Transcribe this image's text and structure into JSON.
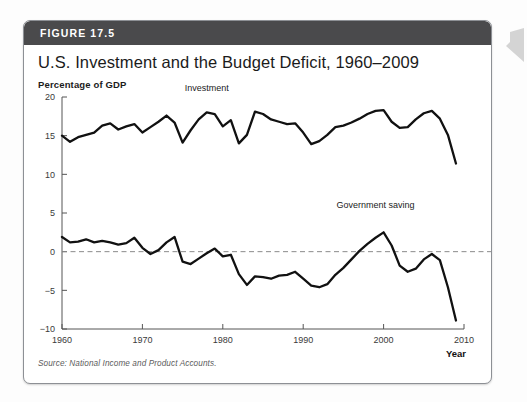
{
  "figure": {
    "number_label": "FIGURE 17.5",
    "title": "U.S. Investment and the Budget Deficit, 1960–2009",
    "source_note": "Source: National Income and Product Accounts.",
    "header_color": "#4a4a4c",
    "line_color": "#111111",
    "zero_line_color": "#8a8a8a"
  },
  "chart_data": {
    "type": "line",
    "title": "U.S. Investment and the Budget Deficit, 1960–2009",
    "subtitle": "",
    "xlabel": "Year",
    "ylabel": "Percentage of GDP",
    "ylim": [
      -10,
      20
    ],
    "xlim": [
      1960,
      2010
    ],
    "y_ticks": [
      -10,
      -5,
      0,
      5,
      10,
      15,
      20
    ],
    "y_tick_labels": [
      "−10",
      "−5",
      "0",
      "5",
      "10",
      "15",
      "20"
    ],
    "x_ticks": [
      1960,
      1970,
      1980,
      1990,
      2000,
      2010
    ],
    "x_tick_labels": [
      "1960",
      "1970",
      "1980",
      "1990",
      "2000",
      "2010"
    ],
    "grid": false,
    "legend_position": "inline-annotations",
    "annotations": [
      {
        "text": "Investment",
        "x": 1978,
        "y": 20.8
      },
      {
        "text": "Government saving",
        "x": 1999,
        "y": 5.6
      }
    ],
    "reference_lines": [
      {
        "y": 0,
        "style": "dashed",
        "color": "#8a8a8a"
      }
    ],
    "x": [
      1960,
      1961,
      1962,
      1963,
      1964,
      1965,
      1966,
      1967,
      1968,
      1969,
      1970,
      1971,
      1972,
      1973,
      1974,
      1975,
      1976,
      1977,
      1978,
      1979,
      1980,
      1981,
      1982,
      1983,
      1984,
      1985,
      1986,
      1987,
      1988,
      1989,
      1990,
      1991,
      1992,
      1993,
      1994,
      1995,
      1996,
      1997,
      1998,
      1999,
      2000,
      2001,
      2002,
      2003,
      2004,
      2005,
      2006,
      2007,
      2008,
      2009
    ],
    "series": [
      {
        "name": "Investment",
        "values": [
          15.0,
          14.2,
          14.8,
          15.1,
          15.4,
          16.3,
          16.6,
          15.8,
          16.2,
          16.5,
          15.4,
          16.1,
          16.8,
          17.6,
          16.7,
          14.1,
          15.7,
          17.1,
          18.0,
          17.8,
          16.2,
          17.0,
          14.0,
          15.1,
          18.1,
          17.8,
          17.1,
          16.8,
          16.5,
          16.6,
          15.4,
          13.9,
          14.3,
          15.1,
          16.1,
          16.3,
          16.7,
          17.2,
          17.8,
          18.2,
          18.3,
          16.8,
          16.0,
          16.1,
          17.1,
          17.9,
          18.2,
          17.2,
          15.1,
          11.4
        ]
      },
      {
        "name": "Government saving",
        "values": [
          1.9,
          1.2,
          1.3,
          1.6,
          1.2,
          1.4,
          1.2,
          0.9,
          1.1,
          1.8,
          0.5,
          -0.3,
          0.2,
          1.2,
          1.9,
          -1.3,
          -1.6,
          -0.9,
          -0.2,
          0.4,
          -0.6,
          -0.4,
          -2.9,
          -4.3,
          -3.2,
          -3.3,
          -3.5,
          -3.1,
          -3.0,
          -2.6,
          -3.5,
          -4.4,
          -4.6,
          -4.2,
          -3.0,
          -2.1,
          -1.0,
          0.1,
          1.0,
          1.8,
          2.5,
          0.8,
          -1.8,
          -2.6,
          -2.2,
          -1.0,
          -0.3,
          -1.1,
          -4.6,
          -8.9
        ]
      }
    ]
  },
  "margin_marker": {
    "name": "chevron-left-icon",
    "color": "#d2d2d2"
  }
}
